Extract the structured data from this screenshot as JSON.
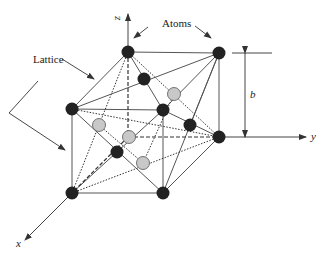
{
  "labels": {
    "atoms": "Atoms",
    "lattice": "Lattice",
    "dimension": "b",
    "axis_x": "x",
    "axis_y": "y",
    "axis_z": "z"
  },
  "colors": {
    "line": "#444444",
    "dark_atom": "#222222",
    "gray_atom": "#c8c8c8",
    "gray_atom_stroke": "#555555"
  },
  "atoms": [
    {
      "id": "top-back-left",
      "x": 128,
      "y": 52,
      "type": "dark"
    },
    {
      "id": "top-back-right",
      "x": 219,
      "y": 53,
      "type": "dark"
    },
    {
      "id": "upper-mid",
      "x": 144,
      "y": 79,
      "type": "dark"
    },
    {
      "id": "gray-upper-right",
      "x": 174,
      "y": 94,
      "type": "gray"
    },
    {
      "id": "top-front-left",
      "x": 72,
      "y": 109,
      "type": "dark"
    },
    {
      "id": "top-front-right",
      "x": 163,
      "y": 110,
      "type": "dark"
    },
    {
      "id": "right-mid",
      "x": 190,
      "y": 125,
      "type": "dark"
    },
    {
      "id": "gray-left",
      "x": 99,
      "y": 125,
      "type": "gray"
    },
    {
      "id": "gray-center",
      "x": 129,
      "y": 137,
      "type": "gray"
    },
    {
      "id": "bottom-back-right",
      "x": 219,
      "y": 137,
      "type": "dark"
    },
    {
      "id": "lower-mid",
      "x": 117,
      "y": 152,
      "type": "dark"
    },
    {
      "id": "gray-lower",
      "x": 143,
      "y": 163,
      "type": "gray"
    },
    {
      "id": "bottom-front-left",
      "x": 72,
      "y": 193,
      "type": "dark"
    },
    {
      "id": "bottom-front-right",
      "x": 163,
      "y": 193,
      "type": "dark"
    }
  ]
}
